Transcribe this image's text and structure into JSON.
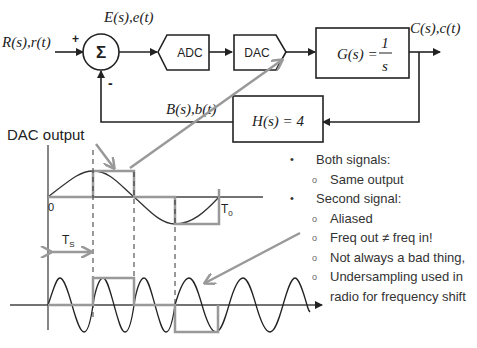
{
  "block_diagram": {
    "input_label": "R(s),r(t)",
    "plus_sign": "+",
    "minus_sign": "-",
    "summer_symbol": "Σ",
    "error_label": "E(s),e(t)",
    "adc_label": "ADC",
    "dac_label": "DAC",
    "plant_label": "G(s) =",
    "plant_num": "1",
    "plant_den": "s",
    "output_label": "C(s),c(t)",
    "feedback_label": "B(s),b(t)",
    "feedback_block": "H(s) = 4"
  },
  "top_plot": {
    "callout": "DAC output",
    "origin_label": "0",
    "period_label": "T",
    "period_sub": "0",
    "sample_label": "T",
    "sample_sub": "S"
  },
  "notes": {
    "items": [
      {
        "level": 1,
        "text": "Both signals:"
      },
      {
        "level": 2,
        "text": "Same output"
      },
      {
        "level": 1,
        "text": "Second signal:"
      },
      {
        "level": 2,
        "text": "Aliased"
      },
      {
        "level": 2,
        "text": " Freq out ≠  freq in!"
      },
      {
        "level": 2,
        "text": "Not always a bad thing,"
      },
      {
        "level": 2,
        "text": "Undersampling used in"
      },
      {
        "level": 3,
        "text": "radio for frequency shift"
      }
    ]
  },
  "colors": {
    "line": "#222222",
    "gray": "#999999"
  }
}
